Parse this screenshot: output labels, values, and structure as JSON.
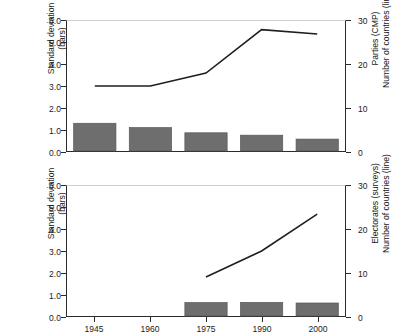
{
  "chart_data": [
    {
      "id": "top",
      "type": "bar",
      "title": "",
      "categories": [
        "1945",
        "1960",
        "1975",
        "1990",
        "2000"
      ],
      "xlabel": "",
      "ylabel": "Standard deviation (bars)",
      "ylabel_line1": "Standard deviation",
      "ylabel_line2": "(bars)",
      "ylim": [
        0.0,
        6.0
      ],
      "yticks": [
        "0.0",
        "1.0",
        "2.0",
        "3.0",
        "4.0",
        "5.0",
        "6.0"
      ],
      "ytick_values": [
        0.0,
        1.0,
        2.0,
        3.0,
        4.0,
        5.0,
        6.0
      ],
      "y2label": "Parties (CMP) Number of countries (line)",
      "y2label_line1": "Parties (CMP)",
      "y2label_line2": "Number of countries (line)",
      "y2lim": [
        0,
        30
      ],
      "y2ticks": [
        "0",
        "10",
        "20",
        "30"
      ],
      "y2tick_values": [
        0,
        10,
        20,
        30
      ],
      "grid": false,
      "legend": "none",
      "series": [
        {
          "name": "Standard deviation",
          "kind": "bar",
          "axis": "left",
          "values": [
            1.28,
            1.08,
            0.84,
            0.73,
            0.55
          ]
        },
        {
          "name": "Number of countries",
          "kind": "line",
          "axis": "right",
          "values": [
            15,
            15,
            18,
            28,
            27
          ]
        }
      ]
    },
    {
      "id": "bottom",
      "type": "bar",
      "title": "",
      "categories": [
        "1945",
        "1960",
        "1975",
        "1990",
        "2000"
      ],
      "xlabel": "",
      "ylabel": "Standard deviation (bars)",
      "ylabel_line1": "Standard deviation",
      "ylabel_line2": "(bars)",
      "ylim": [
        0.0,
        6.0
      ],
      "yticks": [
        "0.0",
        "1.0",
        "2.0",
        "3.0",
        "4.0",
        "5.0",
        "6.0"
      ],
      "ytick_values": [
        0.0,
        1.0,
        2.0,
        3.0,
        4.0,
        5.0,
        6.0
      ],
      "y2label": "Electorates (surveys) Number of countries (line)",
      "y2label_line1": "Electorates (surveys)",
      "y2label_line2": "Number of countries (line)",
      "y2lim": [
        0,
        30
      ],
      "y2ticks": [
        "0",
        "10",
        "20",
        "30"
      ],
      "y2tick_values": [
        0,
        10,
        20,
        30
      ],
      "grid": false,
      "legend": "none",
      "series": [
        {
          "name": "Standard deviation",
          "kind": "bar",
          "axis": "left",
          "values": [
            null,
            null,
            0.62,
            0.63,
            0.6
          ]
        },
        {
          "name": "Number of countries",
          "kind": "line",
          "axis": "right",
          "values": [
            null,
            null,
            9,
            15,
            23.5
          ]
        }
      ]
    }
  ],
  "colors": {
    "bar_fill": "#6e6e6e",
    "bar_stroke": "#565656",
    "line": "#1f1f1f",
    "axis": "#2b2b2b",
    "text": "#1a1a1a",
    "background": "#ffffff"
  }
}
